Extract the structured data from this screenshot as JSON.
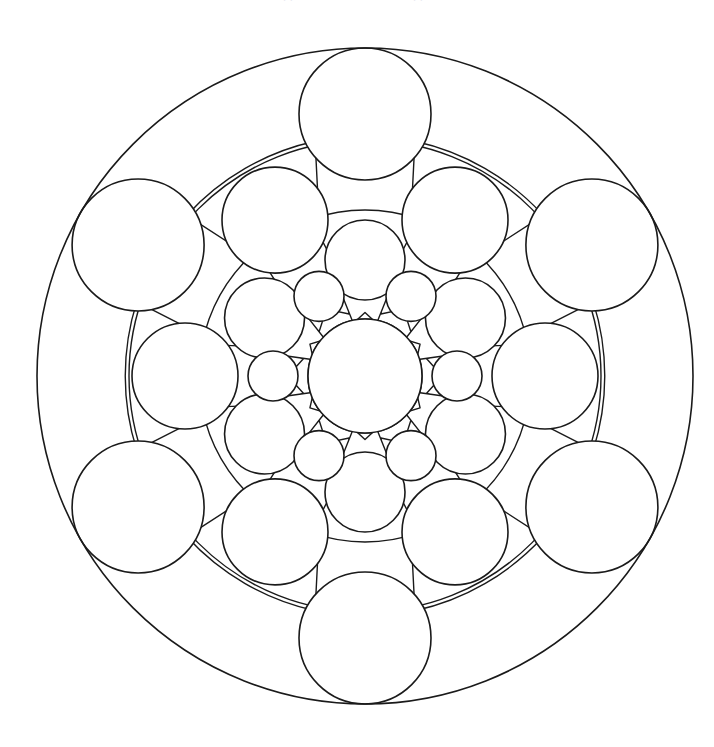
{
  "page": {
    "kind": "line-art-illustration",
    "width": 714,
    "height": 747,
    "background_color": "#ffffff",
    "stroke_color": "#1a1a1a",
    "fill_color": "#ffffff",
    "ghost_text_top": ". ."
  },
  "geometry": {
    "center_x": 365,
    "center_y": 376,
    "symmetry_fold": 6,
    "outer_boundary_radius": 328,
    "ring_boundary_radii": [
      328,
      236,
      156,
      98,
      57
    ],
    "rings": [
      {
        "name": "outer-petal-ring",
        "circle_orbit_radius": 262,
        "circle_radius": 66,
        "count": 6,
        "start_angle_deg": -90,
        "dart_orbit_radius": 240,
        "dart_half_width_deg": 18,
        "dart_inner_radius": 168
      },
      {
        "name": "second-petal-ring",
        "circle_orbit_radius": 180,
        "circle_radius": 53,
        "count": 6,
        "start_angle_deg": -60,
        "dart_orbit_radius": 166,
        "dart_half_width_deg": 19,
        "dart_inner_radius": 112
      },
      {
        "name": "third-petal-ring",
        "circle_orbit_radius": 116,
        "circle_radius": 40,
        "count": 6,
        "start_angle_deg": -90,
        "dart_orbit_radius": 108,
        "dart_half_width_deg": 20,
        "dart_inner_radius": 64
      },
      {
        "name": "inner-petal-ring",
        "circle_orbit_radius": 92,
        "circle_radius": 25,
        "count": 6,
        "start_angle_deg": -60,
        "dart_orbit_radius": 86,
        "dart_half_width_deg": 16,
        "dart_inner_radius": 54
      }
    ],
    "center_circle": {
      "name": "center-circle",
      "radius": 57
    }
  },
  "labels": {
    "outer_boundary": "outer-boundary-circle",
    "center": "center-circle"
  }
}
